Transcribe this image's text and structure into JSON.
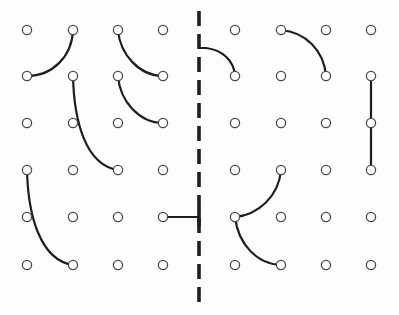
{
  "diagram": {
    "colors": {
      "background": "#ffffff",
      "dot_stroke": "#4a4a4a",
      "line": "#1e1e1e"
    },
    "divider": {
      "x": 199,
      "y_start": 11,
      "y_end": 302,
      "style": "dashed"
    },
    "grid": {
      "rows_y": [
        30,
        76,
        123,
        170,
        217,
        265
      ],
      "left_columns_x": [
        27,
        73,
        118,
        163
      ],
      "right_columns_x": [
        235,
        281,
        326,
        371
      ],
      "dot_radius": 4.6
    },
    "connections": [
      {
        "id": "c1",
        "from": [
          73,
          30
        ],
        "to": [
          27,
          76
        ],
        "shape": "arc",
        "path": "M73,30 C72,57 52,76 27,76"
      },
      {
        "id": "c2",
        "from": [
          118,
          30
        ],
        "to": [
          163,
          76
        ],
        "shape": "arc",
        "path": "M118,30 C120,55 140,76 163,76"
      },
      {
        "id": "c3",
        "from": [
          118,
          76
        ],
        "to": [
          163,
          123
        ],
        "shape": "arc",
        "path": "M118,76 C120,102 140,123 163,123"
      },
      {
        "id": "c4",
        "from": [
          73,
          76
        ],
        "to": [
          118,
          170
        ],
        "shape": "arc",
        "path": "M73,76 C74,120 85,165 118,170"
      },
      {
        "id": "c5",
        "from": [
          27,
          170
        ],
        "to": [
          73,
          265
        ],
        "shape": "arc",
        "path": "M27,170 C28,215 40,260 73,265"
      },
      {
        "id": "c6",
        "from": [
          163,
          217
        ],
        "to": [
          199,
          217
        ],
        "shape": "line",
        "path": "M163,217 L199,217"
      },
      {
        "id": "c7",
        "from": [
          199,
          48
        ],
        "to": [
          235,
          76
        ],
        "shape": "arc",
        "path": "M199,48 L206,48 C222,50 234,60 235,76"
      },
      {
        "id": "c8",
        "from": [
          281,
          30
        ],
        "to": [
          326,
          76
        ],
        "shape": "arc",
        "path": "M281,30 C305,32 324,50 326,76"
      },
      {
        "id": "c9",
        "from": [
          371,
          76
        ],
        "to": [
          371,
          170
        ],
        "shape": "line",
        "path": "M371,76 L371,170"
      },
      {
        "id": "c10",
        "from": [
          281,
          170
        ],
        "to": [
          235,
          217
        ],
        "shape": "arc",
        "path": "M281,170 C279,196 258,215 235,217"
      },
      {
        "id": "c11",
        "from": [
          235,
          217
        ],
        "to": [
          281,
          265
        ],
        "shape": "arc",
        "path": "M235,217 C238,243 256,264 281,265"
      }
    ],
    "divider_cap": {
      "x": 199,
      "y1": 209,
      "y2": 226
    }
  }
}
